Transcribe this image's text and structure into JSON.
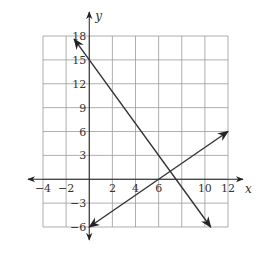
{
  "chart_data": {
    "type": "line",
    "title": "",
    "xlabel": "x",
    "ylabel": "y",
    "xlim": [
      -4,
      12
    ],
    "ylim": [
      -6,
      18
    ],
    "grid": true,
    "x_grid_step": 2,
    "y_grid_step": 3,
    "x_ticks": [
      -4,
      -2,
      2,
      4,
      6,
      10,
      12
    ],
    "x_tick_labels": [
      "−4",
      "−2",
      "2",
      "4",
      "6",
      "10",
      "12"
    ],
    "y_ticks": [
      18,
      15,
      12,
      9,
      6,
      3,
      -3,
      -6
    ],
    "y_tick_labels": [
      "18",
      "15",
      "12",
      "9",
      "6",
      "3",
      "−3",
      "−6"
    ],
    "series": [
      {
        "name": "line-decreasing",
        "equation": "y = -2x + 15",
        "x": [
          -1.3,
          10.5
        ],
        "y": [
          17.6,
          -6
        ],
        "arrows": "both"
      },
      {
        "name": "line-increasing",
        "equation": "y = x - 6",
        "x": [
          0,
          12
        ],
        "y": [
          -6,
          6
        ],
        "arrows": "both"
      }
    ],
    "intersection": {
      "x": 7,
      "y": 1
    },
    "colors": {
      "grid": "#9a9a9a",
      "axis": "#222222",
      "line": "#333333"
    }
  }
}
